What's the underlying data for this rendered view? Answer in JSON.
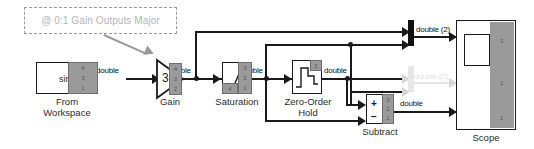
{
  "diagram": {
    "background_color": "#ffffff",
    "line_color": "#1a1a1a",
    "badge_color": "#9a9a9a",
    "faded_color": "#e2e2e2"
  },
  "annotation": {
    "text": "@ 0:1 Gain Outputs Major",
    "style": "dashed-box",
    "text_color": "#b4b4b4",
    "border_color": "#9c9c9c"
  },
  "blocks": {
    "from_workspace": {
      "label_line1": "From",
      "label_line2": "Workspace",
      "signal_text": "sin",
      "badge_ticks": [
        "4",
        "3",
        "1"
      ]
    },
    "gain": {
      "label": "Gain",
      "value": "3",
      "badge_ticks": [
        "4",
        "3",
        "2"
      ]
    },
    "saturation": {
      "label": "Saturation",
      "badge_ticks": [
        "3",
        "2",
        "1"
      ],
      "corner_tick": "4"
    },
    "zero_order_hold": {
      "label_line1": "Zero-Order",
      "label_line2": "Hold",
      "badge_ticks": [
        "2"
      ]
    },
    "subtract": {
      "label": "Subtract",
      "port_plus": "+",
      "port_minus": "−",
      "badge_ticks": [
        "3",
        "2",
        "1"
      ]
    },
    "scope": {
      "label": "Scope",
      "ticks": [
        "3",
        "2",
        "1"
      ]
    },
    "mux_top": {
      "label": "mux-bar",
      "output_label": "double (2)"
    },
    "mux_faded": {
      "label": "mux-bar-faded",
      "output_label": "double (2)"
    }
  },
  "signal_labels": {
    "fw_to_gain": "double",
    "gain_to_saturation": "double",
    "saturation_to_zoh": "double",
    "zoh_out": "double",
    "mux_out": "double (2)",
    "mux_faded_out": "double (2)",
    "subtract_out": "double"
  }
}
